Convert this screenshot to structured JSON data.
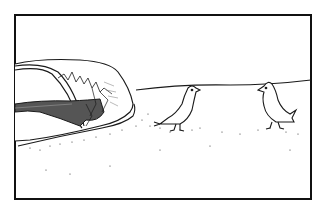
{
  "image": {
    "kind": "single-panel cartoon",
    "description": "Black-and-white line drawing: a half-buried car with a cracked, shattered windshield on the left sinks into a sandy ground; two small birds stand on the sand facing each other on the right, under a low horizon line.",
    "caption": ""
  },
  "colors": {
    "ink": "#1a1a1a",
    "paper": "#ffffff",
    "frame": "#111111"
  },
  "scene": {
    "frame": "panel-border",
    "elements": [
      {
        "name": "buried-car",
        "detail": "car roof and windshield emerging from sand, windshield cracked"
      },
      {
        "name": "bird-left",
        "detail": "small bird facing right, standing on sand"
      },
      {
        "name": "bird-right",
        "detail": "small bird facing left, standing on sand"
      },
      {
        "name": "horizon",
        "detail": "thin horizon line behind birds"
      },
      {
        "name": "sand",
        "detail": "stippled sand texture"
      }
    ]
  }
}
